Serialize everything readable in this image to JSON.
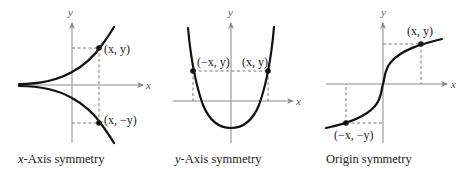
{
  "panels": [
    {
      "id": "x-axis-symmetry",
      "axis_labels": {
        "x": "x",
        "y": "y"
      },
      "points": [
        {
          "label": "(x, y)",
          "label_x": "x",
          "label_y": "y"
        },
        {
          "label": "(x, −y)",
          "label_x": "x",
          "label_y": "−y"
        }
      ],
      "caption_var": "x",
      "caption_rest": "-Axis symmetry"
    },
    {
      "id": "y-axis-symmetry",
      "axis_labels": {
        "x": "x",
        "y": "y"
      },
      "points": [
        {
          "label": "(−x, y)",
          "label_x": "−x",
          "label_y": "y"
        },
        {
          "label": "(x, y)",
          "label_x": "x",
          "label_y": "y"
        }
      ],
      "caption_var": "y",
      "caption_rest": "-Axis symmetry"
    },
    {
      "id": "origin-symmetry",
      "axis_labels": {
        "x": "x",
        "y": "y"
      },
      "points": [
        {
          "label": "(x, y)",
          "label_x": "x",
          "label_y": "y"
        },
        {
          "label": "(−x, −y)",
          "label_x": "−x",
          "label_y": "−y"
        }
      ],
      "caption_var": "",
      "caption_rest": "Origin symmetry"
    }
  ],
  "colors": {
    "curve": "#111111",
    "axis": "#8a8a8a",
    "dash": "#6a6a6a"
  }
}
